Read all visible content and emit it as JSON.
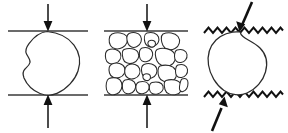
{
  "figure": {
    "background_color": "#ffffff",
    "width": 288,
    "height": 133,
    "line_color": "#2b2b2b",
    "platen_color": "#3a3a3a",
    "arrow_color": "#111111",
    "fill_color": "#ffffff",
    "panel_count": 3,
    "panels": [
      {
        "id": "panel-a",
        "name": "single-particle-smooth-platens",
        "description": "Single rounded irregular particle compressed between two straight smooth horizontal platens",
        "platen_type": "smooth",
        "platen_style": "straight-line",
        "specimen_type": "single-grain",
        "grain_count": 1,
        "load_direction": "vertical",
        "top_arrow": {
          "name": "top-load-arrow",
          "direction": "down",
          "style": "thin",
          "angle_deg": 0
        },
        "bottom_arrow": {
          "name": "bottom-load-arrow",
          "direction": "up",
          "style": "thin",
          "angle_deg": 0
        },
        "top_platen_y": 31,
        "bottom_platen_y": 95,
        "platen_x_start": 8,
        "platen_x_end": 88
      },
      {
        "id": "panel-b",
        "name": "granular-aggregate-smooth-platens",
        "description": "Assembly of many irregular angular grains packed between two straight smooth horizontal platens",
        "platen_type": "smooth",
        "platen_style": "straight-line",
        "specimen_type": "multi-grain-aggregate",
        "grain_count": 21,
        "load_direction": "vertical",
        "top_arrow": {
          "name": "top-load-arrow",
          "direction": "down",
          "style": "thin",
          "angle_deg": 0
        },
        "bottom_arrow": {
          "name": "bottom-load-arrow",
          "direction": "up",
          "style": "thin",
          "angle_deg": 0
        },
        "top_platen_y": 31,
        "bottom_platen_y": 95,
        "platen_x_start": 104,
        "platen_x_end": 188
      },
      {
        "id": "panel-c",
        "name": "single-particle-rough-platens",
        "description": "Single bean shaped particle with concave notch compressed between two rough zigzag platens under inclined load",
        "platen_type": "rough",
        "platen_style": "zigzag-sawtooth",
        "specimen_type": "single-grain",
        "grain_count": 1,
        "load_direction": "inclined",
        "top_arrow": {
          "name": "top-load-arrow",
          "direction": "down-left",
          "style": "thick",
          "angle_deg": 20
        },
        "bottom_arrow": {
          "name": "bottom-load-arrow",
          "direction": "up-right",
          "style": "thick",
          "angle_deg": 20
        },
        "top_platen_y": 31,
        "bottom_platen_y": 95,
        "platen_x_start": 204,
        "platen_x_end": 282,
        "zigzag_teeth": 9,
        "zigzag_amplitude": 4
      }
    ]
  }
}
